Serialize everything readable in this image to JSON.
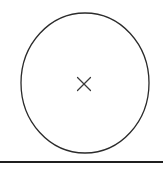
{
  "canvas": {
    "width": 163,
    "height": 170,
    "background_color": "#ffffff",
    "title": "Circle with center mark"
  },
  "figure": {
    "type": "line-drawing",
    "shapes": {
      "circle": {
        "name": "circle-outline",
        "center_x": 85,
        "center_y": 83,
        "radius_x": 64,
        "radius_y": 70,
        "stroke_color": "#2b2b2b",
        "stroke_width": 1.3,
        "fill": "none",
        "bounds": {
          "left": 21,
          "top": 13,
          "right": 149,
          "bottom": 153
        }
      },
      "center_mark": {
        "name": "center-x-marker",
        "glyph": "×",
        "center_x": 84,
        "center_y": 84,
        "size": 13,
        "stroke_color": "#3a3a3a",
        "stroke_width": 1.2
      },
      "baseline_rule": {
        "name": "horizontal-rule",
        "x1": 0,
        "y1": 162,
        "x2": 163,
        "y2": 162,
        "stroke_color": "#1f1f1f",
        "stroke_width": 2.2
      }
    }
  },
  "labels": {
    "circle_label": "circle outline",
    "marker_label": "center mark",
    "rule_label": "baseline rule"
  }
}
